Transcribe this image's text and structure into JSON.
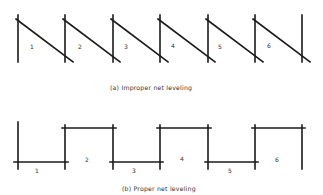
{
  "figure": {
    "part_a": {
      "caption": "(a) Improper net leveling",
      "panel_labels": [
        "1",
        "2",
        "3",
        "4",
        "5",
        "6"
      ]
    },
    "part_b": {
      "caption": "(b) Proper net leveling",
      "panel_labels": [
        "1",
        "2",
        "3",
        "4",
        "5",
        "6"
      ]
    }
  }
}
